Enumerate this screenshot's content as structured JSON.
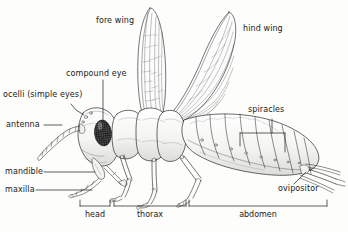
{
  "diagram": {
    "background_color": "#fdfdfb",
    "ink_color": "#1a1a1a",
    "labels": [
      {
        "id": "fore-wing",
        "text": "fore wing",
        "x": 96,
        "y": 20,
        "leader": "none"
      },
      {
        "id": "hind-wing",
        "text": "hind wing",
        "x": 243,
        "y": 28,
        "leader": "none"
      },
      {
        "id": "compound-eye",
        "text": "compound eye",
        "x": 66,
        "y": 73,
        "leader": "vertical-down"
      },
      {
        "id": "ocelli",
        "text": "ocelli (simple eyes)",
        "x": 3,
        "y": 94,
        "leader": "short-diagonal"
      },
      {
        "id": "antenna",
        "text": "antenna",
        "x": 6,
        "y": 122,
        "leader": "horizontal-right"
      },
      {
        "id": "spiracles",
        "text": "spiracles",
        "x": 248,
        "y": 108,
        "leader": "vertical-down-bracket"
      },
      {
        "id": "mandible",
        "text": "mandible",
        "x": 5,
        "y": 169,
        "leader": "horizontal-right"
      },
      {
        "id": "maxilla",
        "text": "maxilla",
        "x": 5,
        "y": 187,
        "leader": "horizontal-right"
      },
      {
        "id": "ovipositor",
        "text": "ovipositor",
        "x": 278,
        "y": 186,
        "leader": "diagonal-up-right"
      }
    ],
    "body_regions": [
      {
        "id": "head",
        "text": "head",
        "bracket_x1": 80,
        "bracket_x2": 110,
        "label_x": 95,
        "y": 208
      },
      {
        "id": "thorax",
        "text": "thorax",
        "bracket_x1": 114,
        "bracket_x2": 186,
        "label_x": 150,
        "y": 208
      },
      {
        "id": "abdomen",
        "text": "abdomen",
        "bracket_x1": 189,
        "bracket_x2": 327,
        "label_x": 258,
        "y": 208
      }
    ],
    "parts": [
      "fore wing",
      "hind wing",
      "compound eye",
      "ocelli (simple eyes)",
      "antenna",
      "spiracles",
      "mandible",
      "maxilla",
      "ovipositor",
      "head",
      "thorax",
      "abdomen"
    ]
  }
}
